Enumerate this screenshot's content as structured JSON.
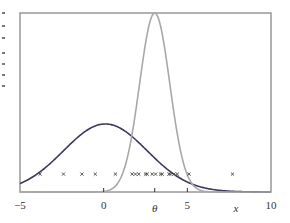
{
  "chart_data": {
    "type": "line",
    "title": "",
    "xlabel": "x",
    "ylabel": "",
    "xlim": [
      -5,
      10
    ],
    "ylim": [
      0,
      1
    ],
    "grid": false,
    "legend": null,
    "x_ticks": [
      {
        "value": -5,
        "label": "−5",
        "italic": false
      },
      {
        "value": 0,
        "label": "0",
        "italic": false
      },
      {
        "value": 3.05,
        "label": "θ",
        "italic": true
      },
      {
        "value": 5,
        "label": "5",
        "italic": false
      },
      {
        "value": 7.9,
        "label": "x",
        "italic": true
      },
      {
        "value": 10,
        "label": "10",
        "italic": false
      }
    ],
    "series": [
      {
        "name": "broad prior (dark)",
        "kind": "gaussian",
        "mean": 0.1,
        "sd": 2.5,
        "peak": 0.38,
        "color": "#3a3a5a",
        "width": 1.6
      },
      {
        "name": "narrow posterior (light)",
        "kind": "gaussian",
        "mean": 3.05,
        "sd": 0.9,
        "peak": 1.0,
        "color": "#a8a8a8",
        "width": 1.6
      },
      {
        "name": "observations",
        "kind": "scatter",
        "marker": "x",
        "y": 0.1,
        "color": "#444444",
        "x": [
          -3.8,
          -2.4,
          -1.3,
          -0.5,
          0.7,
          1.7,
          1.9,
          2.1,
          2.5,
          2.6,
          2.9,
          3.1,
          3.4,
          3.5,
          3.9,
          4.0,
          4.2,
          4.4,
          5.1,
          7.7
        ]
      }
    ]
  },
  "labels": {
    "x_axis_name": "x",
    "theta_label": "θ"
  }
}
